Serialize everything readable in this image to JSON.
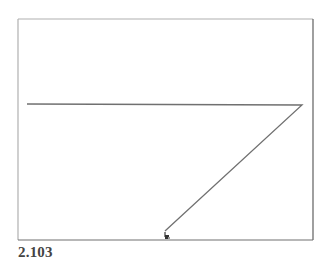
{
  "figure": {
    "caption": "2.103",
    "colors": {
      "frame_left_top": "#b0b0b0",
      "frame_right_bottom": "#606060",
      "line": "#707070",
      "cursor": "#555555"
    },
    "frame": {
      "x1": 18,
      "y1": 19,
      "x2": 313,
      "y2": 240
    },
    "path": [
      {
        "x": 27,
        "y": 104
      },
      {
        "x": 302,
        "y": 105
      },
      {
        "x": 165,
        "y": 231
      }
    ],
    "cursor": {
      "icon": "mouse-pointer-icon",
      "x": 166,
      "y": 236
    }
  }
}
